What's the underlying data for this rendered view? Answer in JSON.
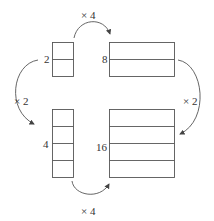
{
  "diagram": {
    "labels": {
      "top_multiplier": "× 4",
      "bottom_multiplier": "× 4",
      "left_multiplier": "× 2",
      "right_multiplier": "× 2",
      "top_left_value": "2",
      "top_right_value": "8",
      "bottom_left_value": "4",
      "bottom_right_value": "16"
    },
    "boxes": [
      {
        "name": "top-left",
        "value": "2",
        "rows": 2
      },
      {
        "name": "top-right",
        "value": "8",
        "rows": 2
      },
      {
        "name": "bottom-left",
        "value": "4",
        "rows": 4
      },
      {
        "name": "bottom-right",
        "value": "16",
        "rows": 4
      }
    ],
    "colors": {
      "stroke": "#555555",
      "text": "#333333"
    }
  }
}
